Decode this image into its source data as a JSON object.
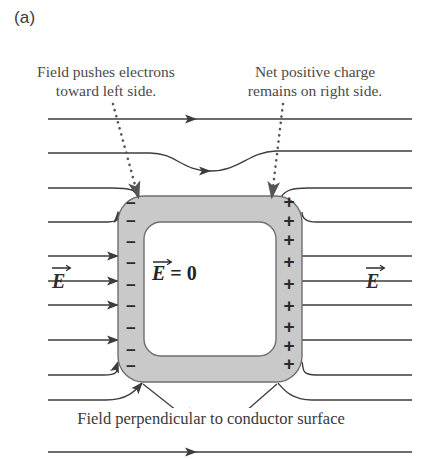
{
  "figure": {
    "panel_label": "(a)",
    "annotation_left": "Field pushes electrons\ntoward left side.",
    "annotation_right": "Net positive charge\nremains on right side.",
    "caption_bottom": "Field perpendicular to conductor surface",
    "efield_label_left": "E",
    "efield_label_right": "E",
    "interior_field_label_symbol": "E",
    "interior_field_label_rest": " = 0",
    "negative_sign": "−",
    "positive_sign": "+",
    "negative_count": 9,
    "positive_count": 9,
    "colors": {
      "conductor_fill": "#c9c9c9",
      "conductor_interior": "#ffffff",
      "conductor_stroke": "#6f6f6f",
      "field_line": "#3c3c3c",
      "text": "#3f3f3f",
      "leader_dotted": "#555555",
      "background": "#ffffff"
    }
  },
  "chart_data": {
    "type": "diagram",
    "field_lines_y": [
      119,
      153,
      188,
      222,
      256,
      281,
      305,
      340,
      375,
      400,
      428,
      452
    ],
    "field_direction": "left-to-right",
    "conductor": {
      "x": 118,
      "y": 196,
      "width": 184,
      "height": 186,
      "corner_radius": 26,
      "band_thickness": 26,
      "interior_label": "E = 0"
    },
    "surface_charges": {
      "left_edge_negative_y": [
        205,
        223,
        244,
        265,
        287,
        308,
        330,
        352,
        368
      ],
      "right_edge_positive_y": [
        203,
        222,
        241,
        263,
        285,
        307,
        328,
        347,
        365
      ]
    },
    "leader_lines": [
      {
        "from": [
          113,
          104
        ],
        "to": [
          138,
          197
        ],
        "style": "dotted",
        "arrow": true
      },
      {
        "from": [
          283,
          104
        ],
        "to": [
          272,
          197
        ],
        "style": "dotted",
        "arrow": true
      },
      {
        "from": [
          143,
          385
        ],
        "to": [
          184,
          417
        ],
        "style": "solid",
        "arrow": false
      },
      {
        "from": [
          277,
          385
        ],
        "to": [
          240,
          417
        ],
        "style": "solid",
        "arrow": false
      }
    ]
  }
}
